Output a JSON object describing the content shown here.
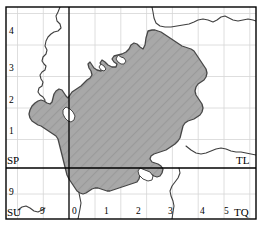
{
  "map": {
    "type": "os-grid-reference-map",
    "title": "Ordnance Survey grid map with shaded study area",
    "frame": {
      "border_color": "#000000",
      "background_color": "#ffffff"
    },
    "colors": {
      "shaded_area_fill": "#a8a8a8",
      "shaded_area_stroke": "#404040",
      "coastline": "#404040",
      "major_gridline": "#000000",
      "minor_gridline": "#d0d0d0",
      "label_text": "#000000"
    },
    "grid": {
      "major_vertical_x_px": 69,
      "major_horizontal_y_px": 168,
      "minor_spacing_px": 25.8,
      "minor_gridlines": "on",
      "origin_label": "0"
    },
    "grid_square_labels": [
      {
        "name": "square-label-sp",
        "text": "SP",
        "corner": "bottom-left-of-upper-left-square",
        "x": 6,
        "y": 158
      },
      {
        "name": "square-label-tl",
        "text": "TL",
        "corner": "bottom-right-of-upper-right-square",
        "x": 239,
        "y": 158
      },
      {
        "name": "square-label-su",
        "text": "SU",
        "corner": "bottom-left-of-lower-left-square",
        "x": 6,
        "y": 210
      },
      {
        "name": "square-label-tq",
        "text": "TQ",
        "corner": "bottom-right-of-lower-right-square",
        "x": 236,
        "y": 210
      }
    ],
    "y_axis": {
      "name": "northing-tick-labels",
      "ticks": [
        {
          "label": "4",
          "y_px": 31
        },
        {
          "label": "3",
          "y_px": 68
        },
        {
          "label": "2",
          "y_px": 100
        },
        {
          "label": "1",
          "y_px": 131
        },
        {
          "label": "9",
          "y_px": 192
        }
      ]
    },
    "x_axis": {
      "name": "easting-tick-labels",
      "ticks": [
        {
          "label": "9",
          "x_px": 43
        },
        {
          "label": "0",
          "x_px": 71
        },
        {
          "label": "1",
          "x_px": 103
        },
        {
          "label": "2",
          "x_px": 136
        },
        {
          "label": "3",
          "x_px": 167
        },
        {
          "label": "4",
          "x_px": 199
        },
        {
          "label": "5",
          "x_px": 230
        }
      ]
    },
    "features": {
      "shaded_region_name": "shaded-study-area",
      "coastline_name": "coastline",
      "hatching": "diagonal-hatch"
    }
  }
}
